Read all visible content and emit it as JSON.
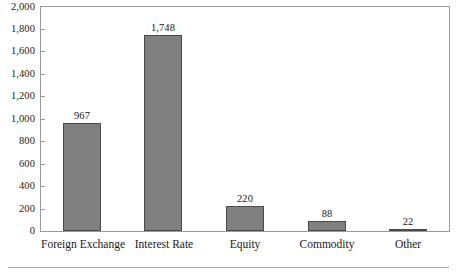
{
  "chart_data": {
    "type": "bar",
    "title": "",
    "subtitle": "",
    "xlabel": "",
    "ylabel": "",
    "categories": [
      "Foreign Exchange",
      "Interest Rate",
      "Equity",
      "Commodity",
      "Other"
    ],
    "values": [
      967,
      1748,
      220,
      88,
      22
    ],
    "value_labels": [
      "967",
      "1,748",
      "220",
      "88",
      "22"
    ],
    "ylim": [
      0,
      2000
    ],
    "yticks": [
      0,
      200,
      400,
      600,
      800,
      1000,
      1200,
      1400,
      1600,
      1800,
      2000
    ],
    "ytick_labels": [
      "0",
      "200",
      "400",
      "600",
      "800",
      "1,000",
      "1,200",
      "1,400",
      "1,600",
      "1,800",
      "2,000"
    ],
    "grid": false,
    "legend": null,
    "legend_position": "none",
    "bar_color": "#808080",
    "bar_edge_color": "#4a4a4a",
    "frame_color": "#9a9a9a",
    "background_color": "#ffffff",
    "text_color": "#1a1a1a"
  }
}
